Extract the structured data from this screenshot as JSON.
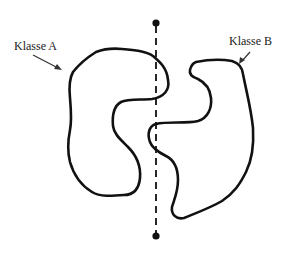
{
  "diagram": {
    "type": "classification-separability-illustration",
    "labels": {
      "class_a": "Klasse A",
      "class_b": "Klasse B"
    },
    "elements": [
      {
        "id": "class-a-region",
        "kind": "closed-curve",
        "label": "Klasse A",
        "side": "left"
      },
      {
        "id": "class-b-region",
        "kind": "closed-curve",
        "label": "Klasse B",
        "side": "right"
      },
      {
        "id": "linear-separator",
        "kind": "dashed-line",
        "orientation": "vertical",
        "endpoints": "dots"
      }
    ],
    "colors": {
      "stroke": "#111111",
      "background": "#ffffff",
      "text": "#222222"
    }
  }
}
